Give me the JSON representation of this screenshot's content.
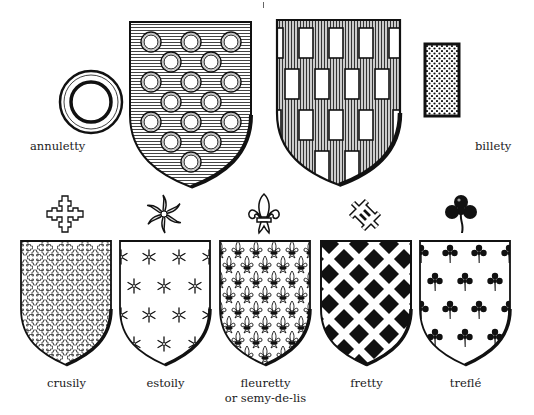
{
  "figure": {
    "top_row": {
      "annuletty": {
        "label": "annuletty",
        "charge": "annulet-icon",
        "field": "horizontal-hatch",
        "charge_count": 18
      },
      "billety": {
        "label": "billety",
        "charge": "billet-icon",
        "field": "vertical-hatch",
        "charge_count": 17
      }
    },
    "bottom_row": [
      {
        "label": "crusily",
        "charge": "cross-crosslet-icon",
        "field": "white"
      },
      {
        "label": "estoily",
        "charge": "estoile-icon",
        "field": "white"
      },
      {
        "label": "fleuretty",
        "label2": "or semy-de-lis",
        "charge": "fleur-de-lis-icon",
        "field": "white"
      },
      {
        "label": "fretty",
        "charge": "fret-knot-icon",
        "field": "black"
      },
      {
        "label": "treflé",
        "charge": "trefoil-icon",
        "field": "white"
      }
    ]
  },
  "colors": {
    "ink": "#111111",
    "paper": "#ffffff",
    "hatch": "#555555"
  }
}
